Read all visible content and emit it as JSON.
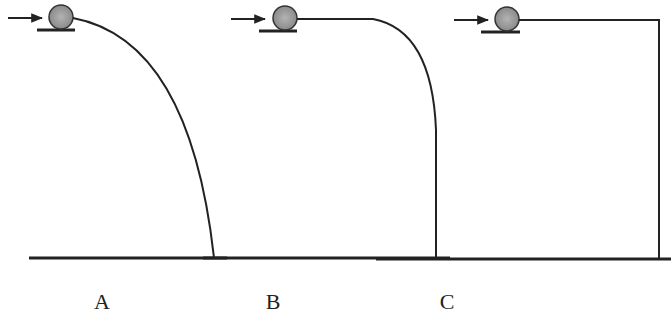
{
  "figure": {
    "panels": [
      {
        "id": "A",
        "label": "A",
        "path_type": "parabolic-curve"
      },
      {
        "id": "B",
        "label": "B",
        "path_type": "flat-then-curve-then-vertical"
      },
      {
        "id": "C",
        "label": "C",
        "path_type": "flat-then-right-angle-vertical"
      }
    ],
    "colors": {
      "line": "#222222",
      "ball_fill": "#9a9a9a",
      "ball_stroke": "#333333"
    },
    "icons": {
      "push_arrow": "arrow-right-icon",
      "ball": "ball-icon"
    }
  }
}
